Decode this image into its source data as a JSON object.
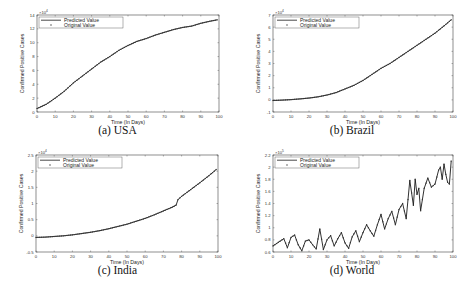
{
  "figure": {
    "captions": [
      "(a) USA",
      "(b) Brazil",
      "(c) India",
      "(d) World"
    ]
  },
  "legend": {
    "predicted": "Predicted Value",
    "original": "Original Value"
  },
  "colors": {
    "line": "#1a1a1a",
    "marker": "#333333",
    "axis": "#444444"
  },
  "chart_data": [
    {
      "type": "line",
      "title": "(a) USA",
      "xlabel": "Time (In Days)",
      "ylabel": "Confirmed Positive Cases",
      "y_multiplier": "×10^4",
      "xlim": [
        0,
        100
      ],
      "ylim": [
        0,
        14
      ],
      "xticks": [
        0,
        10,
        20,
        30,
        40,
        50,
        60,
        70,
        80,
        90,
        100
      ],
      "yticks": [
        0,
        2,
        4,
        6,
        8,
        10,
        12,
        14
      ],
      "legend_position": "upper left",
      "grid": false,
      "x": [
        0,
        5,
        10,
        15,
        20,
        25,
        30,
        35,
        40,
        45,
        50,
        55,
        60,
        65,
        70,
        75,
        80,
        85,
        90,
        95,
        99
      ],
      "series": [
        {
          "name": "Predicted Value",
          "values": [
            0.5,
            1.1,
            2.0,
            3.0,
            4.2,
            5.2,
            6.2,
            7.2,
            8.0,
            8.9,
            9.6,
            10.2,
            10.6,
            11.1,
            11.5,
            11.9,
            12.2,
            12.4,
            12.8,
            13.1,
            13.3
          ]
        },
        {
          "name": "Original Value",
          "values": [
            0.5,
            1.1,
            2.0,
            3.0,
            4.2,
            5.2,
            6.2,
            7.2,
            8.0,
            8.9,
            9.6,
            10.2,
            10.6,
            11.1,
            11.5,
            11.9,
            12.2,
            12.4,
            12.8,
            13.1,
            13.3
          ]
        }
      ]
    },
    {
      "type": "line",
      "title": "(b) Brazil",
      "xlabel": "Time (In Days)",
      "ylabel": "Confirmed Positive Cases",
      "y_multiplier": "×10^4",
      "xlim": [
        0,
        100
      ],
      "ylim": [
        -1,
        7
      ],
      "xticks": [
        0,
        10,
        20,
        30,
        40,
        50,
        60,
        70,
        80,
        90,
        100
      ],
      "yticks": [
        -1,
        0,
        1,
        2,
        3,
        4,
        5,
        6,
        7
      ],
      "legend_position": "upper left",
      "grid": false,
      "x": [
        0,
        5,
        10,
        15,
        20,
        25,
        30,
        35,
        40,
        45,
        50,
        55,
        60,
        65,
        70,
        75,
        80,
        85,
        90,
        95,
        99
      ],
      "series": [
        {
          "name": "Predicted Value",
          "values": [
            -0.05,
            -0.02,
            0.02,
            0.08,
            0.15,
            0.25,
            0.4,
            0.6,
            0.9,
            1.2,
            1.6,
            2.1,
            2.6,
            3.0,
            3.5,
            4.0,
            4.5,
            5.0,
            5.5,
            6.1,
            6.6
          ]
        },
        {
          "name": "Original Value",
          "values": [
            -0.05,
            -0.02,
            0.02,
            0.08,
            0.15,
            0.25,
            0.4,
            0.6,
            0.9,
            1.2,
            1.6,
            2.1,
            2.6,
            3.0,
            3.5,
            4.0,
            4.5,
            5.0,
            5.5,
            6.1,
            6.6
          ]
        }
      ]
    },
    {
      "type": "line",
      "title": "(c) India",
      "xlabel": "Time (In Days)",
      "ylabel": "Confirmed Positive Cases",
      "y_multiplier": "×10^4",
      "xlim": [
        0,
        100
      ],
      "ylim": [
        -0.5,
        2.5
      ],
      "xticks": [
        0,
        10,
        20,
        30,
        40,
        50,
        60,
        70,
        80,
        90,
        100
      ],
      "yticks": [
        -0.5,
        0,
        0.5,
        1,
        1.5,
        2,
        2.5
      ],
      "legend_position": "upper left",
      "grid": false,
      "x": [
        0,
        5,
        10,
        15,
        20,
        25,
        30,
        35,
        40,
        45,
        50,
        55,
        60,
        65,
        70,
        75,
        77,
        78,
        80,
        85,
        90,
        95,
        99
      ],
      "series": [
        {
          "name": "Predicted Value",
          "values": [
            -0.05,
            -0.04,
            -0.02,
            0.0,
            0.03,
            0.07,
            0.11,
            0.16,
            0.22,
            0.29,
            0.36,
            0.45,
            0.54,
            0.65,
            0.77,
            0.89,
            0.95,
            1.12,
            1.22,
            1.43,
            1.64,
            1.86,
            2.05
          ]
        },
        {
          "name": "Original Value",
          "values": [
            -0.05,
            -0.04,
            -0.02,
            0.0,
            0.03,
            0.07,
            0.11,
            0.16,
            0.22,
            0.29,
            0.36,
            0.45,
            0.54,
            0.65,
            0.77,
            0.89,
            0.95,
            1.12,
            1.22,
            1.43,
            1.64,
            1.86,
            2.05
          ]
        }
      ]
    },
    {
      "type": "line",
      "title": "(d) World",
      "xlabel": "Time (In Days)",
      "ylabel": "Confirmed Positive Cases",
      "y_multiplier": "×10^5",
      "xlim": [
        0,
        100
      ],
      "ylim": [
        0.6,
        2.2
      ],
      "xticks": [
        0,
        10,
        20,
        30,
        40,
        50,
        60,
        70,
        80,
        90,
        100
      ],
      "yticks": [
        0.6,
        0.8,
        1,
        1.2,
        1.4,
        1.6,
        1.8,
        2,
        2.2
      ],
      "legend_position": "upper left",
      "grid": false,
      "x": [
        0,
        2,
        4,
        6,
        8,
        10,
        12,
        14,
        16,
        18,
        20,
        22,
        24,
        26,
        28,
        30,
        32,
        34,
        36,
        38,
        40,
        42,
        44,
        46,
        48,
        50,
        52,
        54,
        56,
        58,
        60,
        62,
        64,
        66,
        68,
        70,
        72,
        74,
        76,
        78,
        79,
        80,
        81,
        82,
        84,
        86,
        88,
        90,
        92,
        93,
        94,
        95,
        96,
        97,
        98,
        99
      ],
      "series": [
        {
          "name": "Predicted Value",
          "values": [
            0.7,
            0.74,
            0.78,
            0.82,
            0.67,
            0.84,
            0.88,
            0.72,
            0.62,
            0.78,
            0.8,
            0.72,
            0.65,
            0.98,
            0.64,
            0.8,
            0.87,
            0.7,
            0.82,
            0.92,
            0.75,
            0.66,
            0.85,
            0.95,
            0.77,
            0.92,
            1.05,
            0.95,
            0.86,
            1.05,
            1.22,
            0.98,
            1.15,
            1.27,
            1.05,
            1.3,
            1.4,
            1.15,
            1.78,
            1.37,
            1.8,
            1.55,
            1.65,
            1.28,
            1.65,
            1.82,
            1.67,
            1.72,
            1.95,
            2.0,
            1.8,
            2.05,
            1.88,
            1.75,
            1.72,
            2.1
          ]
        },
        {
          "name": "Original Value",
          "values": [
            0.7,
            0.74,
            0.78,
            0.82,
            0.67,
            0.84,
            0.88,
            0.72,
            0.62,
            0.78,
            0.8,
            0.72,
            0.65,
            0.98,
            0.64,
            0.8,
            0.87,
            0.7,
            0.82,
            0.92,
            0.75,
            0.66,
            0.85,
            0.95,
            0.77,
            0.92,
            1.05,
            0.95,
            0.86,
            1.05,
            1.22,
            0.98,
            1.15,
            1.27,
            1.05,
            1.3,
            1.4,
            1.15,
            1.78,
            1.37,
            1.8,
            1.55,
            1.65,
            1.28,
            1.65,
            1.82,
            1.67,
            1.72,
            1.95,
            2.0,
            1.8,
            2.05,
            1.88,
            1.75,
            1.72,
            2.1
          ]
        }
      ]
    }
  ]
}
